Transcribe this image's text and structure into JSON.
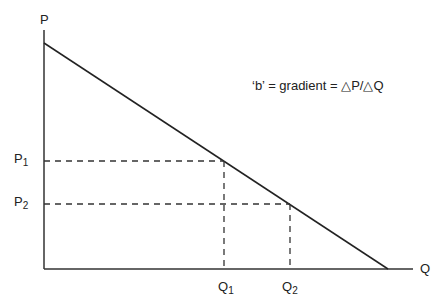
{
  "diagram": {
    "axes": {
      "y_label": "P",
      "x_label": "Q"
    },
    "annotation": "‘b’ = gradient = △P/△Q",
    "price_levels": [
      {
        "base": "P",
        "sub": "1"
      },
      {
        "base": "P",
        "sub": "2"
      }
    ],
    "quantity_levels": [
      {
        "base": "Q",
        "sub": "1"
      },
      {
        "base": "Q",
        "sub": "2"
      }
    ],
    "colors": {
      "line": "#222222",
      "background": "#ffffff"
    }
  }
}
